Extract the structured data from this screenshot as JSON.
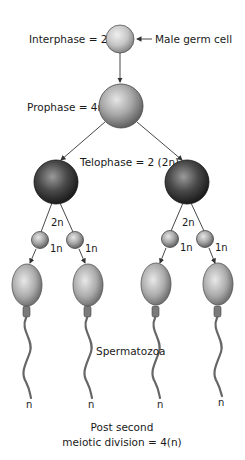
{
  "diagram": {
    "labels": {
      "interphase": "Interphase = 2n",
      "male_germ_cell": "Male germ cell",
      "prophase": "Prophase = 4n",
      "telophase": "Telophase = 2 (2n)",
      "left_2n": "2n",
      "right_2n": "2n",
      "onen_1": "1n",
      "onen_2": "1n",
      "onen_3": "1n",
      "onen_4": "1n",
      "spermatozoa": "Spermatozoa",
      "n_1": "n",
      "n_2": "n",
      "n_3": "n",
      "n_4": "n",
      "post_line1": "Post second",
      "post_line2": "meiotic division = 4(n)"
    },
    "colors": {
      "light_cell": "#c8c8c8",
      "dark_cell": "#3a3a3a",
      "line": "#333333",
      "text": "#1a1a1a"
    }
  }
}
